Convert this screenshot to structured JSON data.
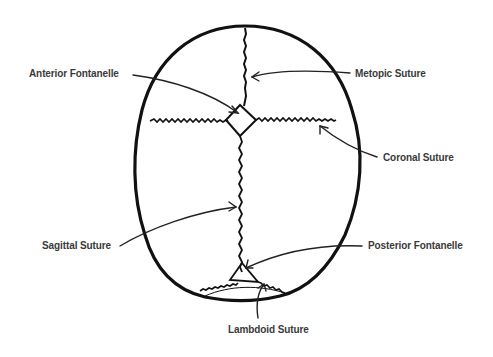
{
  "diagram": {
    "labels": {
      "anterior_fontanelle": "Anterior Fontanelle",
      "metopic_suture": "Metopic Suture",
      "coronal_suture": "Coronal Suture",
      "sagittal_suture": "Sagittal Suture",
      "posterior_fontanelle": "Posterior Fontanelle",
      "lambdoid_suture": "Lambdoid Suture"
    },
    "colors": {
      "outline": "#111111",
      "text": "#3a3a3a",
      "background": "#ffffff"
    }
  }
}
